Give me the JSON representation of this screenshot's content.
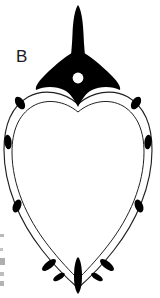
{
  "figure": {
    "panel_label": "B",
    "caption_text": "",
    "background_color": "#ffffff",
    "ink_color": "#000000",
    "outline_color": "#231f20",
    "hole_color": "#ffffff",
    "edge_fragment_color": "#b9b9b9",
    "width": 160,
    "height": 298
  },
  "parts": {
    "stem": {
      "name": "stem",
      "fill": "#000000",
      "top_y": 6,
      "bottom_y": 62,
      "top_width": 9,
      "bottom_width": 15,
      "center_x": 78
    },
    "head": {
      "name": "diamond-head",
      "fill": "#000000",
      "center_x": 78,
      "top_y": 52,
      "bottom_y": 107,
      "left_x": 36,
      "right_x": 120
    },
    "perforation": {
      "name": "perforation-hole",
      "fill": "#ffffff",
      "center_x": 78,
      "center_y": 78,
      "radius": 5.4
    },
    "body": {
      "name": "heart-body",
      "fill": "#ffffff",
      "stroke": "#231f20",
      "stroke_width": 1.1,
      "rim_style": "double-line",
      "apex_x": 78,
      "apex_y": 285,
      "widest_y": 150,
      "left_x": 4,
      "right_x": 152
    },
    "apex_bar": {
      "name": "apex-bar",
      "fill": "#000000",
      "center_x": 78,
      "top_y": 258,
      "bottom_y": 292,
      "width": 7
    }
  },
  "rim_marks": {
    "label": "rim-ovals",
    "fill": "#000000",
    "count": 10,
    "items": [
      {
        "id": "mark-left-1",
        "cx": 20,
        "cy": 103,
        "rx": 4.2,
        "ry": 7.0,
        "rotate": -32
      },
      {
        "id": "mark-right-1",
        "cx": 136,
        "cy": 103,
        "rx": 4.2,
        "ry": 7.0,
        "rotate": 32
      },
      {
        "id": "mark-left-2",
        "cx": 8,
        "cy": 142,
        "rx": 3.6,
        "ry": 7.4,
        "rotate": -6
      },
      {
        "id": "mark-right-2",
        "cx": 148,
        "cy": 142,
        "rx": 3.6,
        "ry": 7.4,
        "rotate": 6
      },
      {
        "id": "mark-left-3",
        "cx": 17,
        "cy": 206,
        "rx": 4.0,
        "ry": 6.8,
        "rotate": 22
      },
      {
        "id": "mark-right-3",
        "cx": 139,
        "cy": 206,
        "rx": 4.0,
        "ry": 6.8,
        "rotate": -22
      },
      {
        "id": "mark-left-4",
        "cx": 49,
        "cy": 265,
        "rx": 3.6,
        "ry": 8.4,
        "rotate": 52
      },
      {
        "id": "mark-right-4",
        "cx": 107,
        "cy": 265,
        "rx": 3.6,
        "ry": 8.4,
        "rotate": -52
      },
      {
        "id": "mark-left-5",
        "cx": 59,
        "cy": 277,
        "rx": 2.8,
        "ry": 6.6,
        "rotate": 58
      },
      {
        "id": "mark-right-5",
        "cx": 97,
        "cy": 277,
        "rx": 2.8,
        "ry": 6.6,
        "rotate": -58
      }
    ]
  },
  "edge_fragments": {
    "label": "cropped-edge-marks",
    "items": [
      {
        "id": "edge-frag-1",
        "x": 0,
        "y": 234,
        "w": 4,
        "h": 3
      },
      {
        "id": "edge-frag-2",
        "x": 0,
        "y": 248,
        "w": 3,
        "h": 3
      },
      {
        "id": "edge-frag-3",
        "x": 0,
        "y": 258,
        "w": 5,
        "h": 7
      },
      {
        "id": "edge-frag-4",
        "x": 0,
        "y": 272,
        "w": 4,
        "h": 4
      },
      {
        "id": "edge-frag-5",
        "x": 0,
        "y": 281,
        "w": 4,
        "h": 5
      }
    ]
  }
}
